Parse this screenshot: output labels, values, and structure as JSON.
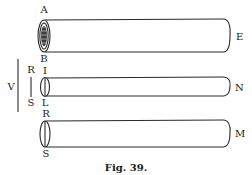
{
  "figure": {
    "caption": "Fig. 39.",
    "colors": {
      "ink": "#2a2a2a",
      "background": "#ffffff"
    },
    "cylinders": [
      {
        "id": "top",
        "left_top_label": "A",
        "left_bottom_label": "B",
        "right_label": "E",
        "end_style": "hatched"
      },
      {
        "id": "middle",
        "left_top_label": "I",
        "left_bottom_label": "L",
        "right_label": "N",
        "end_style": "lens"
      },
      {
        "id": "bottom",
        "left_top_label": "R",
        "left_bottom_label": "S",
        "right_label": "M",
        "end_style": "lens"
      }
    ],
    "scale_bars": {
      "outer_label": "V",
      "inner_top_label": "R",
      "inner_bottom_label": "S"
    }
  }
}
